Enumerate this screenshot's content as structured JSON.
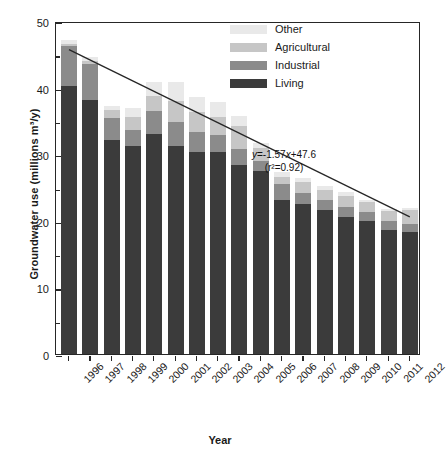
{
  "chart_data": {
    "type": "bar",
    "subtype": "stacked-column",
    "title": "",
    "xlabel": "Year",
    "ylabel": "Groundwater use (millions m³/y)",
    "ylim": [
      0,
      50
    ],
    "ytick_major": [
      0,
      10,
      20,
      30,
      40,
      50
    ],
    "ytick_minor": [
      5,
      15,
      25,
      35,
      45
    ],
    "grid": false,
    "legend_position": "top-right",
    "categories": [
      "1996",
      "1997",
      "1998",
      "1999",
      "2000",
      "2001",
      "2002",
      "2003",
      "2004",
      "2005",
      "2006",
      "2007",
      "2008",
      "2009",
      "2010",
      "2011",
      "2012"
    ],
    "series": [
      {
        "name": "Living",
        "color": "#3b3b3b",
        "values": [
          40.3,
          38.2,
          32.2,
          31.2,
          33.1,
          31.3,
          30.3,
          30.3,
          28.4,
          27.5,
          23.2,
          22.5,
          21.6,
          20.5,
          19.9,
          18.6,
          18.3
        ]
      },
      {
        "name": "Industrial",
        "color": "#8b8b8b",
        "values": [
          5.9,
          5.3,
          3.3,
          2.4,
          3.4,
          3.5,
          3.0,
          2.6,
          2.4,
          1.5,
          2.4,
          1.7,
          1.5,
          1.6,
          1.4,
          1.3,
          1.2
        ]
      },
      {
        "name": "Agricultural",
        "color": "#c6c6c6",
        "values": [
          0.4,
          0.5,
          1.2,
          2.0,
          2.3,
          3.2,
          3.1,
          2.7,
          3.5,
          1.9,
          1.0,
          1.6,
          1.6,
          1.7,
          1.5,
          1.5,
          2.2
        ]
      },
      {
        "name": "Other",
        "color": "#e9e9e9",
        "values": [
          0.6,
          0.6,
          0.6,
          1.3,
          2.0,
          2.9,
          2.2,
          2.2,
          1.4,
          0.8,
          0.7,
          0.6,
          0.5,
          0.5,
          0.4,
          0.4,
          0.3
        ]
      }
    ],
    "totals": [
      47.2,
      44.6,
      37.3,
      36.9,
      40.8,
      40.9,
      38.6,
      37.8,
      35.7,
      31.7,
      27.3,
      26.4,
      25.2,
      24.3,
      23.2,
      21.8,
      22.0
    ],
    "trendline": {
      "equation": "y=-1.57x+47.6",
      "r2_text": "(r²=0.92)",
      "slope": -1.57,
      "intercept": 47.6,
      "r2": 0.92,
      "x_start": "1996",
      "x_end": "2012",
      "y_start": 46.0,
      "y_end": 20.9
    },
    "annotations": [
      {
        "text": "y=-1.57x+47.6",
        "kind": "equation"
      },
      {
        "text": "(r²=0.92)",
        "kind": "fit-quality"
      }
    ]
  },
  "legend": {
    "items": [
      {
        "label": "Other",
        "color": "#e9e9e9"
      },
      {
        "label": "Agricultural",
        "color": "#c6c6c6"
      },
      {
        "label": "Industrial",
        "color": "#8b8b8b"
      },
      {
        "label": "Living",
        "color": "#3b3b3b"
      }
    ]
  },
  "axes": {
    "x_title": "Year",
    "y_title": "Groundwater use (millions m³/y)"
  },
  "equation": {
    "line1_prefix": "y",
    "line1_body": "=-1.57",
    "line1_var": "x",
    "line1_suffix": "+47.6",
    "line2": "(r²=0.92)"
  }
}
